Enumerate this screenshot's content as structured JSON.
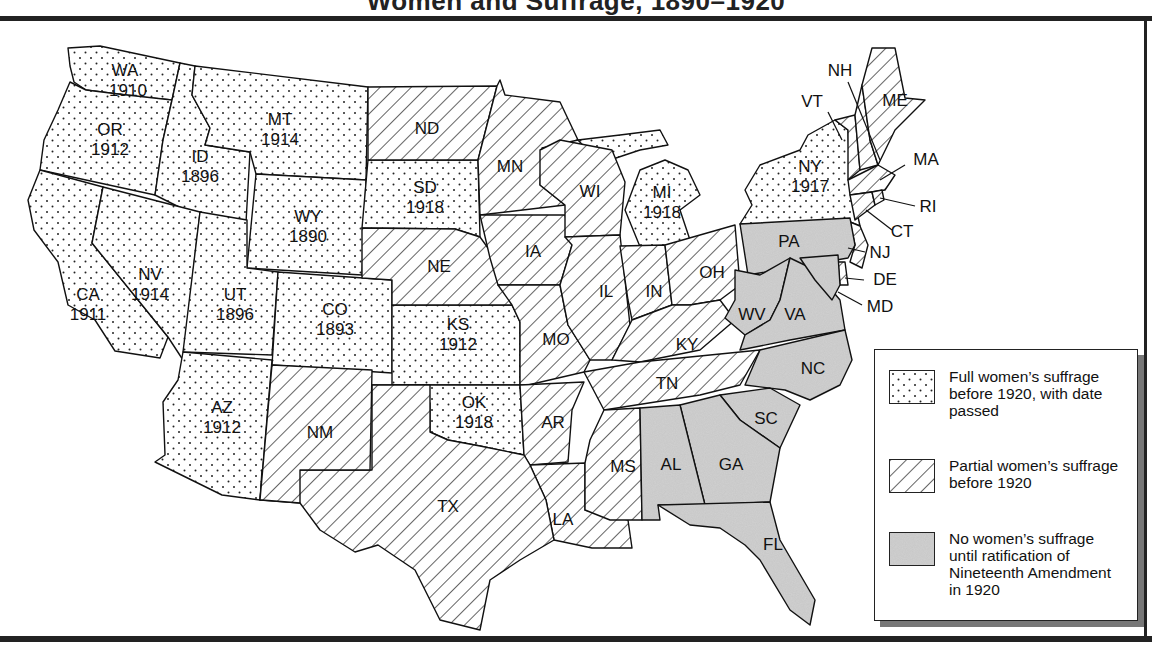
{
  "title": "Women and Suffrage, 1890–1920",
  "legend": {
    "items": [
      {
        "key": "full",
        "pattern": "dots",
        "label": "Full women’s suffrage before 1920, with date passed"
      },
      {
        "key": "partial",
        "pattern": "hatch",
        "label": "Partial women’s suffrage before 1920"
      },
      {
        "key": "none",
        "pattern": "stipple",
        "label": "No women’s suffrage until ratification of Nineteenth Amendment in 1920"
      }
    ]
  },
  "colors": {
    "stroke": "#111111",
    "stipple_fill": "#c8c8c8",
    "frame": "#222222",
    "shadow": "#777777"
  },
  "states": {
    "WA": {
      "abbr": "WA",
      "year": "1910",
      "status": "full"
    },
    "OR": {
      "abbr": "OR",
      "year": "1912",
      "status": "full"
    },
    "CA": {
      "abbr": "CA",
      "year": "1911",
      "status": "full"
    },
    "ID": {
      "abbr": "ID",
      "year": "1896",
      "status": "full"
    },
    "NV": {
      "abbr": "NV",
      "year": "1914",
      "status": "full"
    },
    "MT": {
      "abbr": "MT",
      "year": "1914",
      "status": "full"
    },
    "WY": {
      "abbr": "WY",
      "year": "1890",
      "status": "full"
    },
    "UT": {
      "abbr": "UT",
      "year": "1896",
      "status": "full"
    },
    "CO": {
      "abbr": "CO",
      "year": "1893",
      "status": "full"
    },
    "AZ": {
      "abbr": "AZ",
      "year": "1912",
      "status": "full"
    },
    "SD": {
      "abbr": "SD",
      "year": "1918",
      "status": "full"
    },
    "KS": {
      "abbr": "KS",
      "year": "1912",
      "status": "full"
    },
    "OK": {
      "abbr": "OK",
      "year": "1918",
      "status": "full"
    },
    "MI": {
      "abbr": "MI",
      "year": "1918",
      "status": "full"
    },
    "NY": {
      "abbr": "NY",
      "year": "1917",
      "status": "full"
    },
    "NM": {
      "abbr": "NM",
      "status": "partial"
    },
    "TX": {
      "abbr": "TX",
      "status": "partial"
    },
    "ND": {
      "abbr": "ND",
      "status": "partial"
    },
    "NE": {
      "abbr": "NE",
      "status": "partial"
    },
    "MN": {
      "abbr": "MN",
      "status": "partial"
    },
    "IA": {
      "abbr": "IA",
      "status": "partial"
    },
    "MO": {
      "abbr": "MO",
      "status": "partial"
    },
    "AR": {
      "abbr": "AR",
      "status": "partial"
    },
    "LA": {
      "abbr": "LA",
      "status": "partial"
    },
    "WI": {
      "abbr": "WI",
      "status": "partial"
    },
    "IL": {
      "abbr": "IL",
      "status": "partial"
    },
    "MS": {
      "abbr": "MS",
      "status": "partial"
    },
    "IN": {
      "abbr": "IN",
      "status": "partial"
    },
    "OH": {
      "abbr": "OH",
      "status": "partial"
    },
    "KY": {
      "abbr": "KY",
      "status": "partial"
    },
    "TN": {
      "abbr": "TN",
      "status": "partial"
    },
    "VT": {
      "abbr": "VT",
      "status": "partial"
    },
    "NH": {
      "abbr": "NH",
      "status": "partial"
    },
    "ME": {
      "abbr": "ME",
      "status": "partial"
    },
    "MA": {
      "abbr": "MA",
      "status": "partial"
    },
    "RI": {
      "abbr": "RI",
      "status": "partial"
    },
    "CT": {
      "abbr": "CT",
      "status": "partial"
    },
    "NJ": {
      "abbr": "NJ",
      "status": "partial"
    },
    "DE": {
      "abbr": "DE",
      "status": "partial"
    },
    "PA": {
      "abbr": "PA",
      "status": "none"
    },
    "WV": {
      "abbr": "WV",
      "status": "none"
    },
    "VA": {
      "abbr": "VA",
      "status": "none"
    },
    "MD": {
      "abbr": "MD",
      "status": "none"
    },
    "NC": {
      "abbr": "NC",
      "status": "none"
    },
    "SC": {
      "abbr": "SC",
      "status": "none"
    },
    "GA": {
      "abbr": "GA",
      "status": "none"
    },
    "AL": {
      "abbr": "AL",
      "status": "none"
    },
    "FL": {
      "abbr": "FL",
      "status": "none"
    }
  }
}
